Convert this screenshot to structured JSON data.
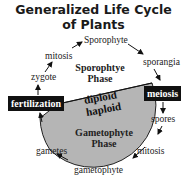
{
  "title": {
    "line1": "Generalized Life Cycle",
    "line2": "of Plants"
  },
  "diagram": {
    "stages": {
      "sporophyte": "Sporophyte",
      "mitosis_top": "mitosis",
      "zygote": "zygote",
      "sporangia": "sporangia",
      "spores": "spores",
      "mitosis_bottom": "mitosis",
      "gametophyte": "gametophyte",
      "gametes": "gametes"
    },
    "events": {
      "fertilization": "fertilization",
      "meiosis": "meiosis"
    },
    "phases": {
      "sporophyte_line1": "Sporophtye",
      "sporophyte_line2": "Phase",
      "gametophyte_line1": "Gametophyte",
      "gametophyte_line2": "Phase"
    },
    "ploidy": {
      "upper": "diploid",
      "lower": "haploid"
    },
    "colors": {
      "haploid_fill": "#b5b5b5",
      "event_box": "#111111"
    }
  }
}
